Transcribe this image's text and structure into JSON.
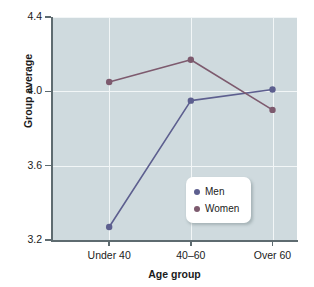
{
  "chart_data": {
    "type": "line",
    "title": "",
    "xlabel": "Age group",
    "ylabel": "Group average",
    "categories": [
      "Under 40",
      "40–60",
      "Over 60"
    ],
    "series": [
      {
        "name": "Men",
        "color": "#5d5f8f",
        "values": [
          3.27,
          3.95,
          4.01
        ]
      },
      {
        "name": "Women",
        "color": "#7d5a6e",
        "values": [
          4.05,
          4.17,
          3.9
        ]
      }
    ],
    "ylim": [
      3.2,
      4.4
    ],
    "yticks": [
      "3.2",
      "3.6",
      "4.0",
      "4.4"
    ],
    "ytick_values": [
      3.2,
      3.6,
      4.0,
      4.4
    ],
    "grid": true,
    "legend_position": "lower-right-inside",
    "plot_background": "#cfdade",
    "grid_color": "#f2f6f7",
    "axis_color": "#5e6b70",
    "figure_background": "#ffffff"
  },
  "axes": {
    "y_title": "Group average",
    "x_title": "Age group"
  },
  "legend": {
    "entries": [
      {
        "label": "Men",
        "color": "#5d5f8f"
      },
      {
        "label": "Women",
        "color": "#7d5a6e"
      }
    ]
  }
}
